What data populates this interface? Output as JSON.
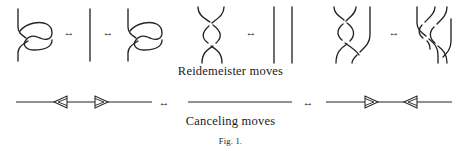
{
  "figure": {
    "caption_number": "Fig. 1.",
    "rows": [
      {
        "id": "reidemeister",
        "label": "Reidemeister moves",
        "equivalence_symbol": "↔",
        "groups": [
          {
            "name": "r1-left-kink",
            "kind": "loop-kink-left",
            "description": "strand with right-hand loop"
          },
          {
            "name": "r1-strand",
            "kind": "single-strand",
            "description": "plain vertical strand"
          },
          {
            "name": "r1-right-kink",
            "kind": "loop-kink-left",
            "description": "strand with right-hand loop"
          },
          {
            "name": "r2-bigon",
            "kind": "double-crossing",
            "description": "two strands crossing twice"
          },
          {
            "name": "r2-parallel",
            "kind": "two-strands",
            "description": "two parallel vertical strands"
          },
          {
            "name": "r3-left",
            "kind": "triple-point-left",
            "description": "three strands, crossing left of third"
          },
          {
            "name": "r3-right",
            "kind": "triple-point-right",
            "description": "three strands, crossing right of third"
          }
        ],
        "arrow_count": 4
      },
      {
        "id": "canceling",
        "label": "Canceling moves",
        "equivalence_symbol": "↔",
        "groups": [
          {
            "name": "canceling-left",
            "kind": "line-two-arrowheads-outward",
            "arrowheads": [
              "left",
              "right"
            ]
          },
          {
            "name": "canceling-middle",
            "kind": "plain-line",
            "arrowheads": []
          },
          {
            "name": "canceling-right",
            "kind": "line-two-arrowheads-inward",
            "arrowheads": [
              "right",
              "left"
            ]
          }
        ],
        "arrow_count": 2
      }
    ]
  },
  "colors": {
    "ink": "#242424",
    "text": "#1a1a1a",
    "background": "#ffffff"
  }
}
